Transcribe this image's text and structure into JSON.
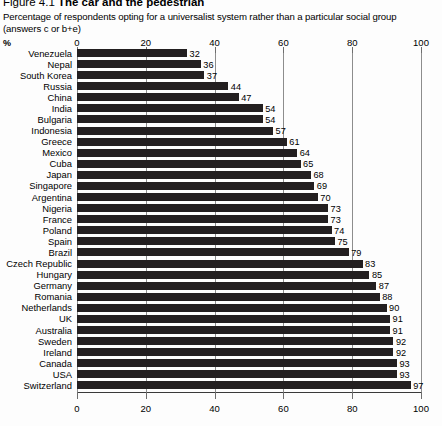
{
  "figure": {
    "number": "Figure 4.1",
    "name": "The car and the pedestrian",
    "subtitle_line1": "Percentage of respondents opting for a universalist system rather than a particular social group",
    "subtitle_line2": "(answers c or b+e)",
    "percent_symbol": "%"
  },
  "chart_data": {
    "type": "bar",
    "orientation": "horizontal",
    "title": "Figure 4.1 The car and the pedestrian",
    "subtitle": "Percentage of respondents opting for a universalist system rather than a particular social group (answers c or b+e)",
    "xlabel": "%",
    "ylabel": "",
    "xlim": [
      0,
      100
    ],
    "xticks": [
      0,
      20,
      40,
      60,
      80,
      100
    ],
    "xtick_labels": [
      "0",
      "20",
      "40",
      "60",
      "80",
      "100"
    ],
    "grid": true,
    "grid_axis": "x",
    "legend": false,
    "axis_top": true,
    "axis_bottom": true,
    "bar_color": "#231f20",
    "categories": [
      "Venezuela",
      "Nepal",
      "South Korea",
      "Russia",
      "China",
      "India",
      "Bulgaria",
      "Indonesia",
      "Greece",
      "Mexico",
      "Cuba",
      "Japan",
      "Singapore",
      "Argentina",
      "Nigeria",
      "France",
      "Poland",
      "Spain",
      "Brazil",
      "Czech Republic",
      "Hungary",
      "Germany",
      "Romania",
      "Netherlands",
      "UK",
      "Australia",
      "Sweden",
      "Ireland",
      "Canada",
      "USA",
      "Switzerland"
    ],
    "values": [
      32,
      36,
      37,
      44,
      47,
      54,
      54,
      57,
      61,
      64,
      65,
      68,
      69,
      70,
      73,
      73,
      74,
      75,
      79,
      83,
      85,
      87,
      88,
      90,
      91,
      91,
      92,
      92,
      93,
      93,
      97
    ]
  }
}
